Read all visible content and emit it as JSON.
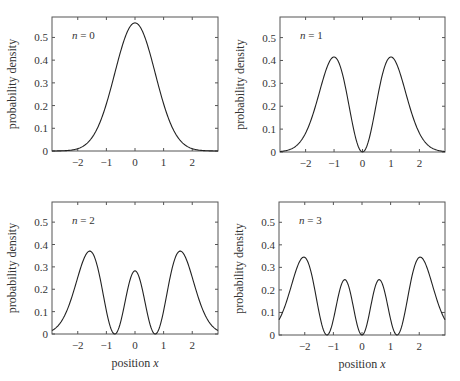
{
  "chart_data": [
    {
      "type": "line",
      "panel": "top-left",
      "annotation": "n = 0",
      "n": 0,
      "title": "",
      "xlabel": "",
      "ylabel": "probability density",
      "xlim": [
        -2.9,
        2.9
      ],
      "ylim": [
        0,
        0.59
      ],
      "xticks": [
        -2,
        -1,
        0,
        1,
        2
      ],
      "xtick_labels": [
        "−2",
        "−1",
        "0",
        "1",
        "2"
      ],
      "yticks": [
        0,
        0.1,
        0.2,
        0.3,
        0.4,
        0.5
      ],
      "ytick_labels": [
        "0",
        "0.1",
        "0.2",
        "0.3",
        "0.4",
        "0.5"
      ],
      "grid": false,
      "series": [
        {
          "name": "|ψ0(x)|²",
          "x": [
            -2.9,
            -2.5,
            -2,
            -1.5,
            -1,
            -0.5,
            0,
            0.5,
            1,
            1.5,
            2,
            2.5,
            2.9
          ],
          "values": [
            0.0001,
            0.001,
            0.01,
            0.059,
            0.208,
            0.44,
            0.564,
            0.44,
            0.208,
            0.059,
            0.01,
            0.001,
            0.0001
          ]
        }
      ]
    },
    {
      "type": "line",
      "panel": "top-right",
      "annotation": "n = 1",
      "n": 1,
      "title": "",
      "xlabel": "",
      "ylabel": "probability density",
      "xlim": [
        -2.9,
        2.9
      ],
      "ylim": [
        0,
        0.59
      ],
      "xticks": [
        -2,
        -1,
        0,
        1,
        2
      ],
      "xtick_labels": [
        "−2",
        "−1",
        "0",
        "1",
        "2"
      ],
      "yticks": [
        0,
        0.1,
        0.2,
        0.3,
        0.4,
        0.5
      ],
      "ytick_labels": [
        "0",
        "0.1",
        "0.2",
        "0.3",
        "0.4",
        "0.5"
      ],
      "grid": false,
      "series": [
        {
          "name": "|ψ1(x)|²",
          "x": [
            -2.9,
            -2.5,
            -2,
            -1.5,
            -1,
            -0.5,
            0,
            0.5,
            1,
            1.5,
            2,
            2.5,
            2.9
          ],
          "values": [
            0.002,
            0.012,
            0.083,
            0.265,
            0.415,
            0.22,
            0.0,
            0.22,
            0.415,
            0.265,
            0.083,
            0.012,
            0.002
          ]
        }
      ]
    },
    {
      "type": "line",
      "panel": "bottom-left",
      "annotation": "n = 2",
      "n": 2,
      "title": "",
      "xlabel": "position x",
      "ylabel": "probability density",
      "xlim": [
        -2.9,
        2.9
      ],
      "ylim": [
        0,
        0.59
      ],
      "xticks": [
        -2,
        -1,
        0,
        1,
        2
      ],
      "xtick_labels": [
        "−2",
        "−1",
        "0",
        "1",
        "2"
      ],
      "yticks": [
        0,
        0.1,
        0.2,
        0.3,
        0.4,
        0.5
      ],
      "ytick_labels": [
        "0",
        "0.1",
        "0.2",
        "0.3",
        "0.4",
        "0.5"
      ],
      "grid": false,
      "series": [
        {
          "name": "|ψ2(x)|²",
          "x": [
            -2.9,
            -2.5,
            -2,
            -1.6,
            -1.2,
            -0.71,
            -0.4,
            0,
            0.4,
            0.71,
            1.2,
            1.6,
            2,
            2.5,
            2.9
          ],
          "values": [
            0.013,
            0.062,
            0.258,
            0.367,
            0.215,
            0.0,
            0.113,
            0.282,
            0.113,
            0.0,
            0.215,
            0.367,
            0.258,
            0.062,
            0.013
          ]
        }
      ]
    },
    {
      "type": "line",
      "panel": "bottom-right",
      "annotation": "n = 3",
      "n": 3,
      "title": "",
      "xlabel": "position x",
      "ylabel": "probability density",
      "xlim": [
        -2.9,
        2.9
      ],
      "ylim": [
        0,
        0.59
      ],
      "xticks": [
        -2,
        -1,
        0,
        1,
        2
      ],
      "xtick_labels": [
        "−2",
        "−1",
        "0",
        "1",
        "2"
      ],
      "yticks": [
        0,
        0.1,
        0.2,
        0.3,
        0.4,
        0.5
      ],
      "ytick_labels": [
        "0",
        "0.1",
        "0.2",
        "0.3",
        "0.4",
        "0.5"
      ],
      "grid": false,
      "series": [
        {
          "name": "|ψ3(x)|²",
          "x": [
            -2.9,
            -2.5,
            -2.0,
            -1.5,
            -1.22,
            -0.9,
            -0.6,
            0,
            0.6,
            0.9,
            1.22,
            1.5,
            2.0,
            2.5,
            2.9
          ],
          "values": [
            0.067,
            0.196,
            0.342,
            0.143,
            0.0,
            0.152,
            0.243,
            0.0,
            0.243,
            0.152,
            0.0,
            0.143,
            0.342,
            0.196,
            0.067
          ]
        }
      ]
    }
  ]
}
